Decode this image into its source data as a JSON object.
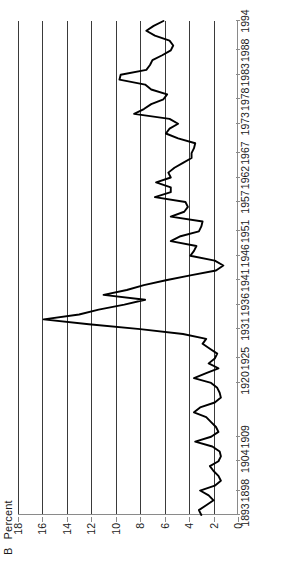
{
  "chart_data": {
    "type": "line",
    "panel_letter": "B",
    "xlabel": "",
    "ylabel": "Percent",
    "ylim": [
      0,
      18
    ],
    "yticks": [
      0,
      2,
      4,
      6,
      8,
      10,
      12,
      14,
      16,
      18
    ],
    "grid": "horizontal-gridlines-at-2-through-16",
    "legend": "none",
    "orientation": "rotated-90-counterclockwise",
    "xtick_labels": [
      "1893",
      "1898",
      "1904",
      "1909",
      "1920",
      "1925",
      "1931",
      "1936",
      "1941",
      "1946",
      "1951",
      "1957",
      "1962",
      "1967",
      "1973",
      "1978",
      "1983",
      "1988",
      "1994"
    ],
    "xlim": [
      1893,
      1994
    ],
    "series": [
      {
        "name": "Percent",
        "x": [
          1893,
          1894,
          1895,
          1896,
          1897,
          1898,
          1899,
          1900,
          1901,
          1902,
          1903,
          1904,
          1905,
          1906,
          1907,
          1908,
          1909,
          1910,
          1911,
          1912,
          1913,
          1914,
          1915,
          1916,
          1917,
          1918,
          1919,
          1920,
          1921,
          1922,
          1923,
          1924,
          1925,
          1926,
          1927,
          1928,
          1929,
          1930,
          1931,
          1932,
          1933,
          1934,
          1935,
          1936,
          1937,
          1938,
          1939,
          1940,
          1941,
          1942,
          1943,
          1944,
          1945,
          1946,
          1947,
          1948,
          1949,
          1950,
          1951,
          1952,
          1953,
          1954,
          1955,
          1956,
          1957,
          1958,
          1959,
          1960,
          1961,
          1962,
          1963,
          1964,
          1965,
          1966,
          1967,
          1968,
          1969,
          1970,
          1971,
          1972,
          1973,
          1974,
          1975,
          1976,
          1977,
          1978,
          1979,
          1980,
          1981,
          1982,
          1983,
          1984,
          1985,
          1986,
          1987,
          1988,
          1989,
          1990,
          1991,
          1992,
          1993,
          1994
        ],
        "values": [
          3.0,
          3.2,
          2.6,
          2.0,
          2.4,
          3.1,
          1.9,
          1.4,
          1.6,
          2.0,
          2.3,
          1.6,
          1.4,
          1.5,
          2.1,
          3.5,
          2.2,
          1.6,
          1.8,
          2.2,
          2.6,
          3.6,
          3.1,
          1.9,
          1.4,
          1.5,
          1.7,
          2.2,
          3.6,
          2.6,
          1.6,
          2.4,
          1.9,
          1.7,
          2.3,
          2.9,
          2.6,
          4.5,
          8.0,
          12.2,
          15.9,
          13.0,
          11.4,
          9.3,
          7.6,
          11.0,
          9.1,
          7.7,
          5.9,
          3.9,
          1.8,
          1.2,
          1.9,
          3.9,
          3.6,
          3.4,
          5.5,
          4.7,
          3.2,
          3.0,
          2.9,
          5.5,
          4.4,
          4.1,
          4.3,
          6.8,
          5.5,
          5.5,
          6.7,
          5.5,
          5.7,
          5.2,
          4.5,
          3.8,
          3.8,
          3.6,
          3.5,
          4.9,
          5.9,
          5.6,
          4.9,
          5.6,
          8.5,
          7.7,
          7.1,
          6.1,
          5.8,
          7.1,
          7.6,
          9.7,
          9.6,
          7.5,
          7.2,
          7.0,
          6.2,
          5.5,
          5.3,
          5.6,
          6.8,
          7.5,
          6.9,
          6.1
        ]
      }
    ],
    "annotations": []
  },
  "axis_caption": {
    "letter": "B",
    "unit": "Percent"
  },
  "colors": {
    "series_line": "#000000",
    "gridline": "#3a3a3a",
    "axis": "#8a8a8a",
    "background": "#ffffff",
    "text": "#1a1a1a"
  }
}
